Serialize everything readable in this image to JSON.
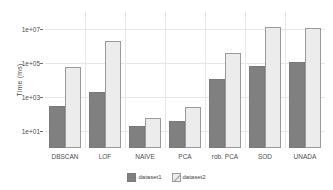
{
  "chart_data": {
    "type": "bar",
    "title": "",
    "xlabel": "",
    "ylabel": "Time (ms)",
    "yscale": "log",
    "ylim": [
      1,
      100000000
    ],
    "grid": true,
    "legend_position": "bottom",
    "categories": [
      "DBSCAN",
      "LOF",
      "NAIVE",
      "PCA",
      "rob. PCA",
      "SOD",
      "UNADA"
    ],
    "series": [
      {
        "name": "dataset1",
        "color": "#808080",
        "values": [
          300,
          2000,
          20,
          40,
          12000,
          70000,
          120000
        ]
      },
      {
        "name": "dataset2",
        "color": "#ececec",
        "values": [
          60000,
          2000000,
          60,
          250,
          400000,
          14000000,
          11000000
        ]
      }
    ],
    "y_ticks": [
      {
        "label": "1e+01",
        "value": 10
      },
      {
        "label": "1e+03",
        "value": 1000
      },
      {
        "label": "1e+05",
        "value": 100000
      },
      {
        "label": "1e+07",
        "value": 10000000
      }
    ],
    "colors": {
      "series1": "#808080",
      "series2": "#ececec",
      "grid": "#e3e7ea",
      "text": "#4d4d4d",
      "background": "#ffffff"
    }
  }
}
